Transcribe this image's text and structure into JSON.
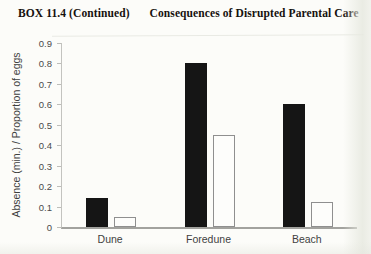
{
  "header": {
    "box_label": "BOX 11.4",
    "continued": "(Continued)",
    "title": "Consequences of Disrupted Parental Care"
  },
  "chart_data": {
    "type": "bar",
    "categories": [
      "Dune",
      "Foredune",
      "Beach"
    ],
    "series": [
      {
        "name": "black-filled",
        "fill": "#151515",
        "values": [
          0.14,
          0.8,
          0.6
        ]
      },
      {
        "name": "white-open",
        "fill": "#fdfdfb",
        "border": "#8f8f8f",
        "values": [
          0.05,
          0.45,
          0.12
        ]
      }
    ],
    "title": "",
    "xlabel": "",
    "ylabel": "Absence (min.) / Proportion of eggs",
    "ylim": [
      0,
      0.9
    ],
    "ytick_step": 0.1,
    "yticks": [
      "0",
      "0.1",
      "0.2",
      "0.3",
      "0.4",
      "0.5",
      "0.6",
      "0.7",
      "0.8",
      "0.9"
    ],
    "grid": false,
    "legend": false
  },
  "colors": {
    "page_bg": "#fcfcf9",
    "bar_black": "#151515",
    "bar_white_border": "#8f8f8f",
    "axis_line": "#a2a29e",
    "tick_text": "#4a4a4a",
    "title_text": "#16110e"
  }
}
